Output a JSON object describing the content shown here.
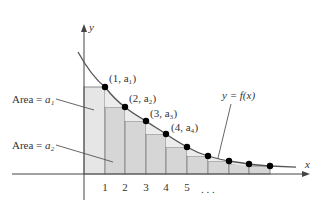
{
  "axes": {
    "x_label": "x",
    "y_label": "y",
    "ticks": [
      "1",
      "2",
      "3",
      "4",
      "5"
    ],
    "ellipsis": ". . ."
  },
  "curve": {
    "label_prefix": "y = ",
    "label_func": "f(x)"
  },
  "points": [
    {
      "n": "1",
      "label": "(1, a₁)"
    },
    {
      "n": "2",
      "label": "(2, a₂)"
    },
    {
      "n": "3",
      "label": "(3, a₃)"
    },
    {
      "n": "4",
      "label": "(4, a₄)"
    }
  ],
  "annotations": {
    "area1_prefix": "Area = ",
    "area1_var": "a₁",
    "area2_prefix": "Area = ",
    "area2_var": "a₂"
  },
  "colors": {
    "rect_first": "#e6e6e6",
    "rect_rest": "#d4d4d4",
    "rect_edge": "#8a8a8a",
    "curve": "#555555",
    "axis": "#444444",
    "dot": "#000000"
  }
}
